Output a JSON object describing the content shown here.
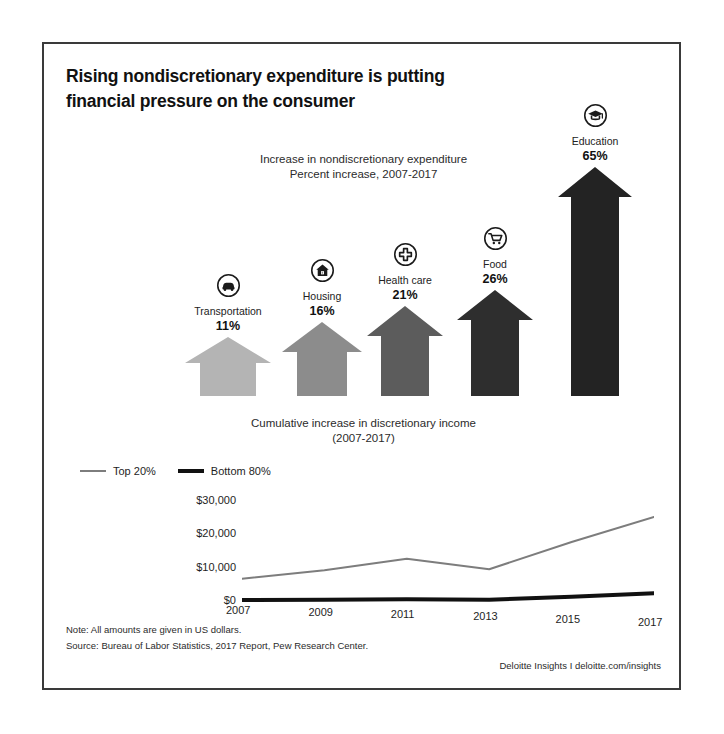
{
  "title": "Rising nondiscretionary expenditure is putting financial pressure on the consumer",
  "title_line1": "Rising nondiscretionary expenditure is putting",
  "title_line2": "financial pressure on the consumer",
  "arrow_section": {
    "subtitle_line1": "Increase in nondiscretionary expenditure",
    "subtitle_line2": "Percent increase, 2007-2017"
  },
  "line_section": {
    "title_line1": "Cumulative increase in discretionary income",
    "title_line2": "(2007-2017)"
  },
  "footer": {
    "note": "Note: All amounts are given in US dollars.",
    "source": "Source: Bureau of Labor Statistics, 2017 Report, Pew Research Center.",
    "credit": "Deloitte Insights I deloitte.com/insights"
  },
  "chart_data": [
    {
      "type": "bar",
      "title": "Increase in nondiscretionary expenditure",
      "subtitle": "Percent increase, 2007-2017",
      "xlabel": "",
      "ylabel": "Percent increase",
      "ylim": [
        0,
        65
      ],
      "grid": false,
      "legend": "none",
      "categories": [
        "Transportation",
        "Housing",
        "Health care",
        "Food",
        "Education"
      ],
      "values": [
        11,
        16,
        21,
        26,
        65
      ],
      "value_labels": [
        "11%",
        "16%",
        "21%",
        "26%",
        "65%"
      ],
      "icons": [
        "car-icon",
        "house-icon",
        "medical-cross-icon",
        "shopping-cart-icon",
        "graduation-cap-icon"
      ],
      "colors": [
        "#b4b4b4",
        "#8c8c8c",
        "#5c5c5c",
        "#2e2e2e",
        "#232323"
      ]
    },
    {
      "type": "line",
      "title": "Cumulative increase in discretionary income",
      "subtitle": "(2007-2017)",
      "xlabel": "",
      "ylabel": "",
      "x": [
        2007,
        2009,
        2011,
        2013,
        2015,
        2017
      ],
      "xticklabels": [
        "2007",
        "2009",
        "2011",
        "2013",
        "2015",
        "2017"
      ],
      "yticklabels": [
        "$0",
        "$10,000",
        "$20,000",
        "$30,000"
      ],
      "yticks": [
        0,
        10000,
        20000,
        30000
      ],
      "ylim": [
        0,
        33000
      ],
      "grid": false,
      "legend_position": "above-left",
      "series": [
        {
          "name": "Top 20%",
          "color": "#7d7d7d",
          "width": 2,
          "values": [
            7000,
            9500,
            13000,
            9800,
            18000,
            25500
          ]
        },
        {
          "name": "Bottom 80%",
          "color": "#111111",
          "width": 4,
          "values": [
            600,
            700,
            800,
            700,
            1600,
            2600
          ]
        }
      ]
    }
  ]
}
